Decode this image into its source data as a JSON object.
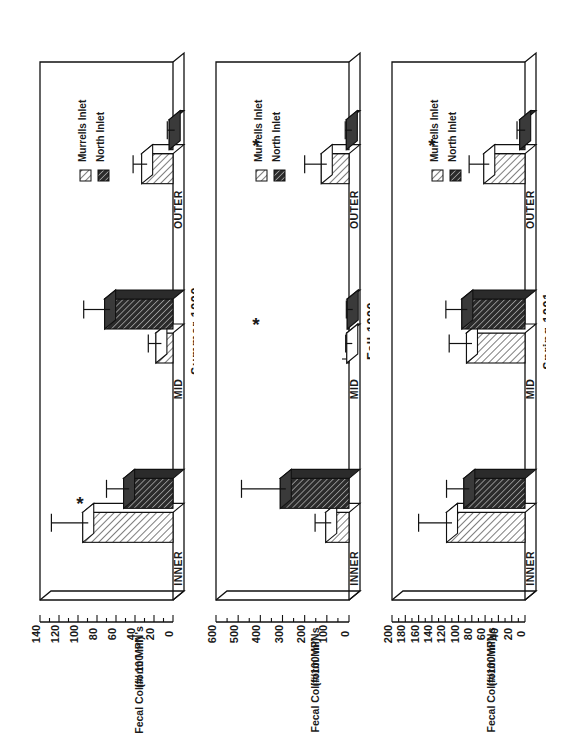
{
  "figure": {
    "legend": {
      "items": [
        {
          "label": "Murrells Inlet",
          "swatch": "light-hatch",
          "color": "#ffffff"
        },
        {
          "label": "North Inlet",
          "swatch": "dark-hatch",
          "color": "#333333"
        }
      ]
    },
    "significance_marker": "*",
    "categories": [
      "INNER",
      "MID",
      "OUTER"
    ]
  },
  "chart_data": [
    {
      "type": "bar",
      "title": "Summer 1990",
      "ylabel": "Fecal Coliform MPN's\n(#/ 100 ml)",
      "ylabel_line1": "Fecal Coliform MPN's",
      "ylabel_line2": "(#/ 100 ml)",
      "xlabel": "",
      "categories": [
        "INNER",
        "MID",
        "OUTER"
      ],
      "ylim": [
        0,
        140
      ],
      "yticks": [
        0,
        20,
        40,
        60,
        80,
        100,
        120,
        140
      ],
      "minor_tick_step": 10,
      "grid": false,
      "legend_position": "top-left",
      "series": [
        {
          "name": "Murrells Inlet",
          "values": [
            95,
            18,
            33
          ],
          "errors": [
            33,
            8,
            9
          ]
        },
        {
          "name": "North Inlet",
          "values": [
            52,
            72,
            4
          ],
          "errors": [
            18,
            22,
            2
          ]
        }
      ],
      "annotations": [
        {
          "text": "*",
          "category": "INNER"
        }
      ]
    },
    {
      "type": "bar",
      "title": "Fall 1990",
      "ylabel": "Fecal Coliform MPNs\n(#/100 ml)",
      "ylabel_line1": "Fecal Coliform MPNs",
      "ylabel_line2": "(#/100 ml)",
      "xlabel": "",
      "categories": [
        "INNER",
        "MID",
        "OUTER"
      ],
      "ylim": [
        0,
        600
      ],
      "yticks": [
        0,
        100,
        200,
        300,
        400,
        500,
        600
      ],
      "minor_tick_step": 50,
      "grid": false,
      "legend_position": "top-left",
      "series": [
        {
          "name": "Murrells Inlet",
          "values": [
            105,
            10,
            125
          ],
          "errors": [
            48,
            5,
            75
          ]
        },
        {
          "name": "North Inlet",
          "values": [
            310,
            8,
            12
          ],
          "errors": [
            175,
            4,
            5
          ]
        }
      ],
      "annotations": [
        {
          "text": "*",
          "category": "MID"
        },
        {
          "text": "*",
          "category": "OUTER"
        }
      ]
    },
    {
      "type": "bar",
      "title": "Spring 1991",
      "ylabel": "Fecal Coliform MPNs\n(#/100 ml)",
      "ylabel_line1": "Fecal Coliform MPNs",
      "ylabel_line2": "(#/100 ml)",
      "xlabel": "",
      "categories": [
        "INNER",
        "MID",
        "OUTER"
      ],
      "ylim": [
        0,
        200
      ],
      "yticks": [
        0,
        20,
        40,
        60,
        80,
        100,
        120,
        140,
        160,
        180,
        200
      ],
      "minor_tick_step": 10,
      "grid": false,
      "legend_position": "top-left",
      "series": [
        {
          "name": "Murrells Inlet",
          "values": [
            118,
            88,
            62
          ],
          "errors": [
            42,
            26,
            22
          ]
        },
        {
          "name": "North Inlet",
          "values": [
            92,
            95,
            8
          ],
          "errors": [
            26,
            24,
            4
          ]
        }
      ],
      "annotations": [
        {
          "text": "*",
          "category": "OUTER"
        }
      ]
    }
  ]
}
